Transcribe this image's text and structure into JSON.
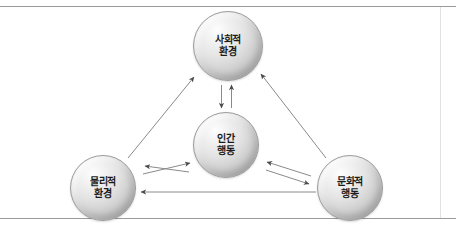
{
  "figure": {
    "title": "",
    "colors": {
      "rule": "#9a9a9a",
      "edge": "#7d7d7d",
      "node_fill_light": "#fdfdfd",
      "node_fill_dark": "#a2a2a2",
      "node_border": "#9c9c9c",
      "text": "#1b1b1b"
    }
  },
  "nodes": [
    {
      "id": "social-environment",
      "line1": "사회적",
      "line2": "환경",
      "self_loop": true
    },
    {
      "id": "human-behavior",
      "line1": "인간",
      "line2": "행동",
      "self_loop": true
    },
    {
      "id": "physical-environment",
      "line1": "물리적",
      "line2": "환경",
      "self_loop": true
    },
    {
      "id": "cultural-behavior",
      "line1": "문화적",
      "line2": "행동",
      "self_loop": true
    }
  ],
  "edges": [
    {
      "id": "social-to-human",
      "from": "social-environment",
      "to": "human-behavior",
      "style": "solid",
      "direction": "down"
    },
    {
      "id": "human-to-social",
      "from": "human-behavior",
      "to": "social-environment",
      "style": "solid",
      "direction": "up"
    },
    {
      "id": "physical-to-human",
      "from": "physical-environment",
      "to": "human-behavior",
      "style": "solid",
      "direction": "up-right"
    },
    {
      "id": "human-to-physical",
      "from": "human-behavior",
      "to": "physical-environment",
      "style": "solid",
      "direction": "down-left"
    },
    {
      "id": "cultural-to-human",
      "from": "cultural-behavior",
      "to": "human-behavior",
      "style": "solid",
      "direction": "up-left"
    },
    {
      "id": "human-to-cultural",
      "from": "human-behavior",
      "to": "cultural-behavior",
      "style": "solid",
      "direction": "down-right"
    },
    {
      "id": "physical-to-social",
      "from": "physical-environment",
      "to": "social-environment",
      "style": "solid",
      "direction": "up-right"
    },
    {
      "id": "cultural-to-social",
      "from": "cultural-behavior",
      "to": "social-environment",
      "style": "solid",
      "direction": "up-left"
    },
    {
      "id": "cultural-to-physical",
      "from": "cultural-behavior",
      "to": "physical-environment",
      "style": "solid",
      "direction": "left"
    }
  ]
}
